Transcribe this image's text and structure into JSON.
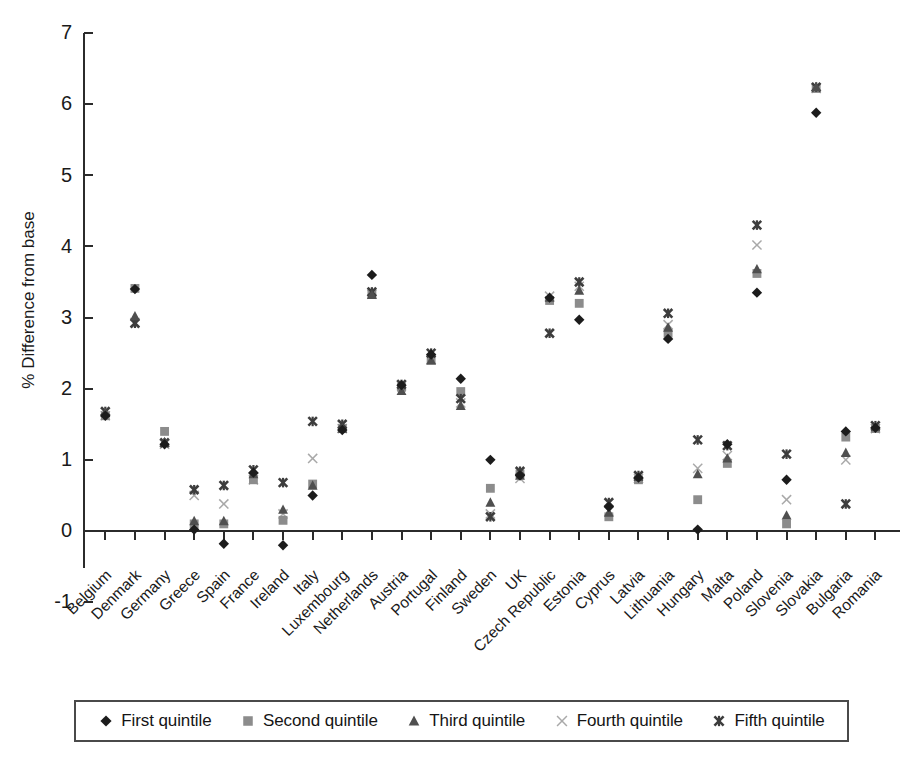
{
  "chart_data": {
    "type": "scatter",
    "title": "",
    "xlabel": "",
    "ylabel": "% Difference from base",
    "ylim": [
      -1,
      7
    ],
    "ytick_values": [
      -1,
      0,
      1,
      2,
      3,
      4,
      5,
      6,
      7
    ],
    "ytick_labels": [
      "-1",
      "0",
      "1",
      "2",
      "3",
      "4",
      "5",
      "6",
      "7"
    ],
    "grid": false,
    "legend_position": "bottom",
    "zero_line": true,
    "categories": [
      "Belgium",
      "Denmark",
      "Germany",
      "Greece",
      "Spain",
      "France",
      "Ireland",
      "Italy",
      "Luxembourg",
      "Netherlands",
      "Austria",
      "Portugal",
      "Finland",
      "Sweden",
      "UK",
      "Czech Republic",
      "Estonia",
      "Cyprus",
      "Latvia",
      "Lithuania",
      "Hungary",
      "Malta",
      "Poland",
      "Slovenia",
      "Slovakia",
      "Bulgaria",
      "Romania"
    ],
    "series": [
      {
        "name": "First quintile",
        "marker": "diamond",
        "color": "#1c1c1c",
        "values": [
          1.62,
          3.4,
          1.22,
          0.02,
          -0.18,
          0.82,
          -0.2,
          0.5,
          1.42,
          3.6,
          2.05,
          2.48,
          2.14,
          1.0,
          0.78,
          3.28,
          2.97,
          0.34,
          0.75,
          2.7,
          0.02,
          1.22,
          3.35,
          0.72,
          5.88,
          1.4,
          1.45
        ]
      },
      {
        "name": "Second quintile",
        "marker": "square",
        "color": "#8c8c8c",
        "values": [
          1.62,
          3.41,
          1.4,
          0.1,
          0.1,
          0.72,
          0.15,
          0.66,
          1.44,
          3.33,
          2.02,
          2.4,
          1.96,
          0.6,
          0.8,
          3.24,
          3.2,
          0.2,
          0.72,
          2.78,
          0.44,
          0.95,
          3.62,
          0.1,
          6.22,
          1.32,
          1.44
        ]
      },
      {
        "name": "Third quintile",
        "marker": "triangle",
        "color": "#4f4f4f",
        "values": [
          1.66,
          3.02,
          1.25,
          0.14,
          0.14,
          0.8,
          0.3,
          0.64,
          1.44,
          3.32,
          1.97,
          2.4,
          1.76,
          0.4,
          0.78,
          3.28,
          3.38,
          0.26,
          0.76,
          2.86,
          0.8,
          1.02,
          3.68,
          0.22,
          6.24,
          1.1,
          1.46
        ]
      },
      {
        "name": "Fourth quintile",
        "marker": "x-light",
        "color": "#a9a9a9",
        "values": [
          1.62,
          2.93,
          1.22,
          0.5,
          0.38,
          0.72,
          0.24,
          1.02,
          1.44,
          3.33,
          2.04,
          2.41,
          1.8,
          0.24,
          0.74,
          3.3,
          3.44,
          0.28,
          0.74,
          2.9,
          0.88,
          1.06,
          4.02,
          0.44,
          6.22,
          1.0,
          1.44
        ]
      },
      {
        "name": "Fifth quintile",
        "marker": "x-bold",
        "color": "#3d3d3d",
        "values": [
          1.68,
          2.92,
          1.24,
          0.58,
          0.64,
          0.86,
          0.68,
          1.54,
          1.5,
          3.36,
          2.06,
          2.5,
          1.86,
          0.2,
          0.84,
          2.78,
          3.5,
          0.4,
          0.78,
          3.06,
          1.28,
          1.2,
          4.3,
          1.08,
          6.24,
          0.38,
          1.48
        ]
      }
    ]
  },
  "legend": {
    "items": [
      {
        "label": "First quintile",
        "marker": "diamond",
        "color": "#1c1c1c"
      },
      {
        "label": "Second quintile",
        "marker": "square",
        "color": "#8c8c8c"
      },
      {
        "label": "Third quintile",
        "marker": "triangle",
        "color": "#4f4f4f"
      },
      {
        "label": "Fourth quintile",
        "marker": "x-light",
        "color": "#a9a9a9"
      },
      {
        "label": "Fifth quintile",
        "marker": "x-bold",
        "color": "#3d3d3d"
      }
    ]
  }
}
